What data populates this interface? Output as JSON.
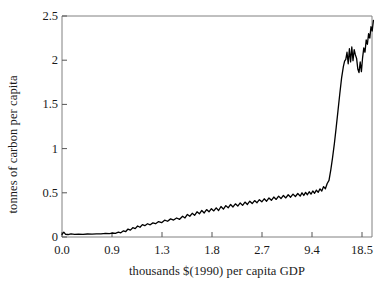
{
  "chart_data": {
    "type": "line",
    "title": "",
    "xlabel": "thousands $(1990) per capita GDP",
    "ylabel": "tonnes of carbon per capita",
    "xtick_labels": [
      "0.0",
      "0.9",
      "1.3",
      "1.8",
      "2.7",
      "9.4",
      "18.5"
    ],
    "ytick_labels": [
      "0",
      "0.5",
      "1",
      "1.5",
      "2",
      "2.5"
    ],
    "ylim": [
      0,
      2.5
    ],
    "x_scale": "nonlinear-categorical (log-like GDP bins, evenly spaced ticks)",
    "grid": false,
    "legend": null,
    "line_color": "#000000",
    "frame_color": "#808080",
    "background": "#ffffff",
    "series": [
      {
        "name": "carbon per capita vs GDP per capita",
        "comment": "x values are axis-fraction positions 0..1 across the 0.0-to-18.5 tick span; y in tonnes of carbon per capita",
        "points": [
          [
            0.0,
            0.03
          ],
          [
            0.006,
            0.055
          ],
          [
            0.012,
            0.03
          ],
          [
            0.02,
            0.028
          ],
          [
            0.03,
            0.035
          ],
          [
            0.042,
            0.03
          ],
          [
            0.055,
            0.032
          ],
          [
            0.07,
            0.03
          ],
          [
            0.085,
            0.034
          ],
          [
            0.1,
            0.032
          ],
          [
            0.115,
            0.036
          ],
          [
            0.13,
            0.035
          ],
          [
            0.145,
            0.04
          ],
          [
            0.158,
            0.038
          ],
          [
            0.168,
            0.045
          ],
          [
            0.178,
            0.042
          ],
          [
            0.188,
            0.055
          ],
          [
            0.196,
            0.048
          ],
          [
            0.205,
            0.07
          ],
          [
            0.212,
            0.06
          ],
          [
            0.22,
            0.09
          ],
          [
            0.228,
            0.078
          ],
          [
            0.236,
            0.105
          ],
          [
            0.244,
            0.095
          ],
          [
            0.252,
            0.125
          ],
          [
            0.26,
            0.11
          ],
          [
            0.268,
            0.14
          ],
          [
            0.276,
            0.128
          ],
          [
            0.285,
            0.15
          ],
          [
            0.294,
            0.138
          ],
          [
            0.303,
            0.16
          ],
          [
            0.312,
            0.15
          ],
          [
            0.322,
            0.175
          ],
          [
            0.332,
            0.162
          ],
          [
            0.342,
            0.19
          ],
          [
            0.352,
            0.178
          ],
          [
            0.362,
            0.205
          ],
          [
            0.372,
            0.192
          ],
          [
            0.382,
            0.215
          ],
          [
            0.392,
            0.2
          ],
          [
            0.402,
            0.235
          ],
          [
            0.41,
            0.215
          ],
          [
            0.418,
            0.255
          ],
          [
            0.426,
            0.235
          ],
          [
            0.434,
            0.268
          ],
          [
            0.442,
            0.245
          ],
          [
            0.45,
            0.285
          ],
          [
            0.458,
            0.262
          ],
          [
            0.466,
            0.3
          ],
          [
            0.474,
            0.272
          ],
          [
            0.482,
            0.31
          ],
          [
            0.49,
            0.285
          ],
          [
            0.498,
            0.32
          ],
          [
            0.506,
            0.295
          ],
          [
            0.514,
            0.33
          ],
          [
            0.522,
            0.3
          ],
          [
            0.53,
            0.345
          ],
          [
            0.538,
            0.315
          ],
          [
            0.546,
            0.355
          ],
          [
            0.554,
            0.33
          ],
          [
            0.562,
            0.368
          ],
          [
            0.57,
            0.34
          ],
          [
            0.578,
            0.375
          ],
          [
            0.586,
            0.35
          ],
          [
            0.594,
            0.385
          ],
          [
            0.602,
            0.358
          ],
          [
            0.61,
            0.395
          ],
          [
            0.618,
            0.368
          ],
          [
            0.626,
            0.405
          ],
          [
            0.634,
            0.378
          ],
          [
            0.642,
            0.412
          ],
          [
            0.65,
            0.388
          ],
          [
            0.658,
            0.422
          ],
          [
            0.666,
            0.398
          ],
          [
            0.674,
            0.432
          ],
          [
            0.682,
            0.405
          ],
          [
            0.69,
            0.442
          ],
          [
            0.698,
            0.415
          ],
          [
            0.706,
            0.452
          ],
          [
            0.714,
            0.425
          ],
          [
            0.722,
            0.462
          ],
          [
            0.73,
            0.435
          ],
          [
            0.738,
            0.47
          ],
          [
            0.746,
            0.442
          ],
          [
            0.754,
            0.478
          ],
          [
            0.762,
            0.45
          ],
          [
            0.77,
            0.485
          ],
          [
            0.778,
            0.458
          ],
          [
            0.786,
            0.492
          ],
          [
            0.794,
            0.462
          ],
          [
            0.8,
            0.5
          ],
          [
            0.806,
            0.47
          ],
          [
            0.812,
            0.505
          ],
          [
            0.818,
            0.478
          ],
          [
            0.824,
            0.512
          ],
          [
            0.83,
            0.485
          ],
          [
            0.836,
            0.52
          ],
          [
            0.842,
            0.495
          ],
          [
            0.848,
            0.53
          ],
          [
            0.854,
            0.505
          ],
          [
            0.86,
            0.545
          ],
          [
            0.866,
            0.52
          ],
          [
            0.872,
            0.57
          ],
          [
            0.878,
            0.545
          ],
          [
            0.884,
            0.605
          ],
          [
            0.89,
            0.64
          ],
          [
            0.896,
            0.76
          ],
          [
            0.902,
            0.9
          ],
          [
            0.908,
            1.06
          ],
          [
            0.914,
            1.24
          ],
          [
            0.92,
            1.43
          ],
          [
            0.926,
            1.62
          ],
          [
            0.932,
            1.8
          ],
          [
            0.938,
            1.93
          ],
          [
            0.942,
            1.99
          ],
          [
            0.946,
            2.01
          ],
          [
            0.95,
            2.09
          ],
          [
            0.954,
            1.96
          ],
          [
            0.958,
            2.13
          ],
          [
            0.962,
            1.98
          ],
          [
            0.966,
            2.15
          ],
          [
            0.97,
            1.995
          ],
          [
            0.974,
            2.12
          ],
          [
            0.978,
            2.06
          ],
          [
            0.982,
            2.02
          ],
          [
            0.986,
            1.9
          ],
          [
            0.99,
            1.86
          ],
          [
            0.994,
            1.98
          ],
          [
            0.998,
            1.87
          ],
          [
            1.002,
            2.03
          ],
          [
            1.006,
            2.14
          ],
          [
            1.01,
            2.09
          ],
          [
            1.014,
            2.23
          ],
          [
            1.018,
            2.18
          ],
          [
            1.022,
            2.3
          ],
          [
            1.026,
            2.25
          ],
          [
            1.03,
            2.38
          ],
          [
            1.034,
            2.33
          ],
          [
            1.038,
            2.45
          ]
        ]
      }
    ]
  },
  "axes": {
    "xlabel": "thousands $(1990) per capita GDP",
    "ylabel": "tonnes of carbon per capita"
  }
}
